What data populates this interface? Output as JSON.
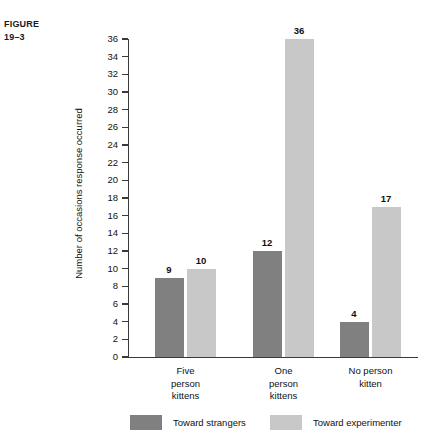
{
  "figure": {
    "label_line1": "FIGURE",
    "label_line2": "19–3"
  },
  "chart_data": {
    "type": "bar",
    "title": "",
    "xlabel": "",
    "ylabel": "Number of occasions response occurred",
    "ylim": [
      0,
      36
    ],
    "ytick_step": 2,
    "grid": false,
    "legend_position": "bottom",
    "categories": [
      "Five person kittens",
      "One person kittens",
      "No person kitten"
    ],
    "category_lines": [
      [
        "Five",
        "person",
        "kittens"
      ],
      [
        "One",
        "person",
        "kittens"
      ],
      [
        "No person",
        "kitten"
      ]
    ],
    "yticks": [
      0,
      2,
      4,
      6,
      8,
      10,
      12,
      14,
      16,
      18,
      20,
      22,
      24,
      26,
      28,
      30,
      32,
      34,
      36
    ],
    "series": [
      {
        "name": "Toward strangers",
        "color": "#808080",
        "values": [
          9,
          12,
          4
        ]
      },
      {
        "name": "Toward experimenter",
        "color": "#c8c8c8",
        "values": [
          10,
          36,
          17
        ]
      }
    ]
  },
  "legend": {
    "entries": [
      {
        "label": "Toward strangers",
        "color": "#808080"
      },
      {
        "label": "Toward experimenter",
        "color": "#c8c8c8"
      }
    ]
  }
}
